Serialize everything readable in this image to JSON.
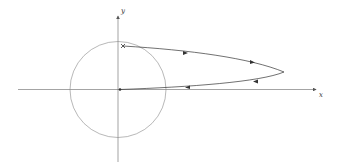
{
  "figure": {
    "type": "phase-plane trajectory diagram",
    "axes": {
      "x_label": "x",
      "y_label": "y"
    },
    "elements": {
      "circle": "unit circle centered at origin",
      "trajectory": "closed loop starting at marked point near top of y-axis, going right, turning back and returning to origin",
      "start_marker": "×",
      "end_marker": "filled dot at origin"
    },
    "colors": {
      "axes": "#555555",
      "circle": "#777777",
      "trajectory": "#333333"
    }
  }
}
